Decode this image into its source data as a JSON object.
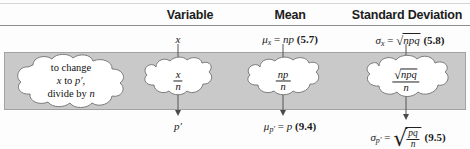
{
  "figure": {
    "kind": "statistics-formula-table",
    "band_color": "#c9c9c9",
    "rule_color": "#8d8d8d"
  },
  "headers": {
    "variable": "Variable",
    "mean": "Mean",
    "standard_deviation": "Standard Deviation"
  },
  "top_row": {
    "variable": "x",
    "mean": {
      "symbol": "μ",
      "subscript": "x",
      "equals": "=",
      "expression": "np",
      "reference": "(5.7)"
    },
    "std": {
      "symbol": "σ",
      "subscript": "x",
      "equals": "=",
      "radicand": "npq",
      "reference": "(5.8)"
    }
  },
  "clouds": {
    "note": {
      "line1": "to change",
      "line2_pre": "x",
      "line2_mid": "to",
      "line2_post": "p′,",
      "line3_pre": "divide by",
      "line3_post": "n"
    },
    "variable": {
      "numerator": "x",
      "denominator": "n"
    },
    "mean": {
      "numerator": "np",
      "denominator": "n"
    },
    "std": {
      "numerator_radicand": "npq",
      "denominator": "n"
    }
  },
  "bottom_row": {
    "variable": "p′",
    "mean": {
      "symbol": "μ",
      "subscript": "p′",
      "equals": "=",
      "expression": "p",
      "reference": "(9.4)"
    },
    "std": {
      "symbol": "σ",
      "subscript": "p′",
      "equals": "=",
      "radicand_numerator": "pq",
      "radicand_denominator": "n",
      "reference": "(9.5)"
    }
  }
}
